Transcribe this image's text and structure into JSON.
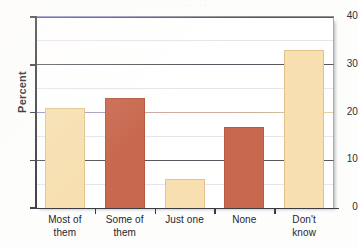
{
  "figure": {
    "background_color": "#fdfdfc",
    "plot_background_color": "#ffffff",
    "axis_color": "#3b3b42"
  },
  "artifacts": {
    "bleed_top": "· · · · · · · · · · · · ·",
    "bleed_left": "",
    "bleed_inner": ""
  },
  "chart_data": {
    "type": "bar",
    "title": "",
    "xlabel": "",
    "ylabel": "Percent",
    "categories": [
      "Most of them",
      "Some of them",
      "Just one",
      "None",
      "Don't know"
    ],
    "category_lines": [
      [
        "Most of",
        "them"
      ],
      [
        "Some of",
        "them"
      ],
      [
        "Just one",
        ""
      ],
      [
        "None",
        ""
      ],
      [
        "Don't",
        "know"
      ]
    ],
    "values": [
      21,
      23,
      6,
      17,
      33
    ],
    "ylim": [
      0,
      40
    ],
    "yticks": [
      0,
      10,
      20,
      30,
      40
    ],
    "ytick_labels": [
      "0",
      "10",
      "20",
      "30",
      "40"
    ],
    "grid": true,
    "legend": false,
    "bar_colors": [
      "#F7DFAF",
      "#C8694F",
      "#F7DFAF",
      "#C8694F",
      "#F7DFAF"
    ],
    "bar_edge_colors": [
      "#E3C48C",
      "#B65A42",
      "#E3C48C",
      "#B65A42",
      "#E3C48C"
    ],
    "palette": {
      "cream": "#F7DFAF",
      "terracotta": "#C8694F",
      "axis": "#3b3b42",
      "gridline_major": "#4a4a52",
      "gridline_tint": "#8a86bd"
    }
  }
}
